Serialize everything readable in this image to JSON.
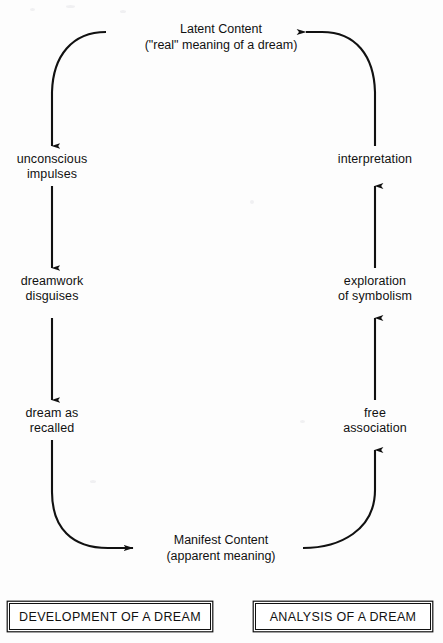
{
  "diagram": {
    "title_top": "Latent Content\n(\"real\" meaning of a dream)",
    "title_bottom": "Manifest Content\n(apparent meaning)",
    "left_column": {
      "heading": "DEVELOPMENT OF A DREAM",
      "steps": [
        "unconscious\nimpulses",
        "dreamwork\ndisguises",
        "dream as\nrecalled"
      ]
    },
    "right_column": {
      "heading": "ANALYSIS OF A DREAM",
      "steps": [
        "interpretation",
        "exploration\nof symbolism",
        "free\nassociation"
      ]
    },
    "colors": {
      "ink": "#111111",
      "paper": "#fdfdfd"
    }
  }
}
